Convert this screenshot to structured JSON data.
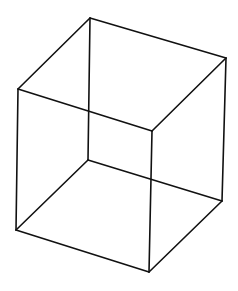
{
  "diagram": {
    "type": "wireframe-cube",
    "stroke_color": "#111111",
    "background": "#ffffff",
    "vertices": {
      "top_back": [
        90,
        18
      ],
      "top_left": [
        18,
        89
      ],
      "top_right": [
        226,
        58
      ],
      "top_front": [
        152,
        131
      ],
      "bottom_back": [
        88,
        160
      ],
      "bottom_left": [
        16,
        230
      ],
      "bottom_right": [
        222,
        201
      ],
      "bottom_front": [
        149,
        272
      ]
    },
    "edges": [
      [
        "top_back",
        "top_left"
      ],
      [
        "top_back",
        "top_right"
      ],
      [
        "top_left",
        "top_front"
      ],
      [
        "top_right",
        "top_front"
      ],
      [
        "bottom_back",
        "bottom_left"
      ],
      [
        "bottom_back",
        "bottom_right"
      ],
      [
        "bottom_left",
        "bottom_front"
      ],
      [
        "bottom_right",
        "bottom_front"
      ],
      [
        "top_back",
        "bottom_back"
      ],
      [
        "top_left",
        "bottom_left"
      ],
      [
        "top_right",
        "bottom_right"
      ],
      [
        "top_front",
        "bottom_front"
      ]
    ]
  }
}
